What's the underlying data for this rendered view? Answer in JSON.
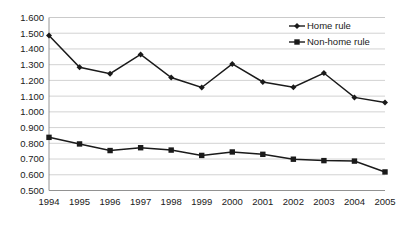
{
  "chart_data": {
    "type": "line",
    "title": "",
    "subtitle": "",
    "xlabel": "",
    "ylabel": "",
    "categories": [
      "1994",
      "1995",
      "1996",
      "1997",
      "1998",
      "1999",
      "2000",
      "2001",
      "2002",
      "2003",
      "2004",
      "2005"
    ],
    "x": [
      1994,
      1995,
      1996,
      1997,
      1998,
      1999,
      2000,
      2001,
      2002,
      2003,
      2004,
      2005
    ],
    "series": [
      {
        "name": "Home rule",
        "marker": "diamond",
        "color": "#1a1a1a",
        "values": [
          1.485,
          1.283,
          1.243,
          1.365,
          1.218,
          1.155,
          1.305,
          1.19,
          1.157,
          1.247,
          1.092,
          1.06
        ]
      },
      {
        "name": "Non-home rule",
        "marker": "square",
        "color": "#1a1a1a",
        "values": [
          0.838,
          0.796,
          0.754,
          0.772,
          0.757,
          0.723,
          0.745,
          0.73,
          0.699,
          0.69,
          0.687,
          0.618
        ]
      }
    ],
    "ylim": [
      0.5,
      1.6
    ],
    "ytick_step": 0.1,
    "ytick_labels": [
      "1.600",
      "1.500",
      "1.400",
      "1.300",
      "1.200",
      "1.100",
      "1.000",
      "0.900",
      "0.800",
      "0.700",
      "0.600",
      "0.500"
    ],
    "ytick_values": [
      1.6,
      1.5,
      1.4,
      1.3,
      1.2,
      1.1,
      1.0,
      0.9,
      0.8,
      0.7,
      0.6,
      0.5
    ],
    "grid": true,
    "grid_color": "#c8c8c8",
    "axis_color": "#8a8a8a",
    "legend_position": "top-right",
    "legend_entries": [
      "Home rule",
      "Non-home rule"
    ],
    "background": "#ffffff"
  }
}
